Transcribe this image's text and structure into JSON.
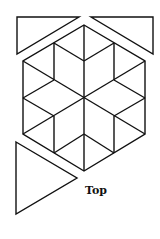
{
  "diagram": {
    "label": "Top",
    "stroke_color": "#111111",
    "background": "#ffffff",
    "hexagon": {
      "center": [
        84,
        98
      ],
      "vertices": [
        [
          84,
          25
        ],
        [
          145,
          61
        ],
        [
          145,
          134
        ],
        [
          84,
          171
        ],
        [
          23,
          134
        ],
        [
          23,
          61
        ]
      ]
    },
    "triangles": [
      {
        "name": "top-left-triangle",
        "points": [
          [
            17,
            17
          ],
          [
            79,
            17
          ],
          [
            17,
            54
          ]
        ]
      },
      {
        "name": "top-right-triangle",
        "points": [
          [
            91,
            17
          ],
          [
            153,
            17
          ],
          [
            153,
            54
          ]
        ]
      },
      {
        "name": "bottom-left-triangle",
        "points": [
          [
            16,
            142
          ],
          [
            77,
            178
          ],
          [
            16,
            214
          ]
        ]
      }
    ]
  }
}
